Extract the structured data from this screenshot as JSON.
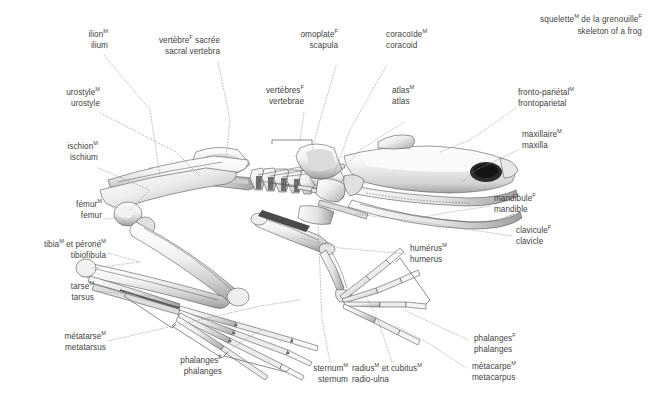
{
  "title": {
    "fr": "squelette",
    "fr_sup": "M",
    "fr_rest": " de la grenouille",
    "fr_sup2": "F",
    "en": "skeleton of a frog"
  },
  "figure": {
    "style": "grayscale anatomical illustration",
    "background_color": "#ffffff",
    "text_color": "#3f3f3f",
    "leader_line_color": "#9a9a9a"
  },
  "labels": [
    {
      "id": "ilium",
      "fr_main": "ilion",
      "fr_sup": "M",
      "fr_tail": "",
      "en": "ilium",
      "align": "right"
    },
    {
      "id": "sacral-vertebra",
      "fr_main": "vertèbre",
      "fr_sup": "F",
      "fr_tail": " sacrée",
      "en": "sacral vertebra",
      "align": "right"
    },
    {
      "id": "scapula",
      "fr_main": "omoplate",
      "fr_sup": "F",
      "fr_tail": "",
      "en": "scapula",
      "align": "right"
    },
    {
      "id": "coracoid",
      "fr_main": "coracoïde",
      "fr_sup": "M",
      "fr_tail": "",
      "en": "coracoid",
      "align": "left"
    },
    {
      "id": "urostyle",
      "fr_main": "urostyle",
      "fr_sup": "M",
      "fr_tail": "",
      "en": "urostyle",
      "align": "right"
    },
    {
      "id": "vertebrae",
      "fr_main": "vertèbres",
      "fr_sup": "F",
      "fr_tail": "",
      "en": "vertebrae",
      "align": "right"
    },
    {
      "id": "atlas",
      "fr_main": "atlas",
      "fr_sup": "M",
      "fr_tail": "",
      "en": "atlas",
      "align": "left"
    },
    {
      "id": "frontoparietal",
      "fr_main": "fronto-pariétal",
      "fr_sup": "M",
      "fr_tail": "",
      "en": "frontoparietal",
      "align": "left"
    },
    {
      "id": "ischium",
      "fr_main": "ischion",
      "fr_sup": "M",
      "fr_tail": "",
      "en": "ischium",
      "align": "right"
    },
    {
      "id": "maxilla",
      "fr_main": "maxillaire",
      "fr_sup": "M",
      "fr_tail": "",
      "en": "maxilla",
      "align": "left"
    },
    {
      "id": "femur",
      "fr_main": "fémur",
      "fr_sup": "M",
      "fr_tail": "",
      "en": "femur",
      "align": "right"
    },
    {
      "id": "mandible",
      "fr_main": "mandibule",
      "fr_sup": "F",
      "fr_tail": "",
      "en": "mandible",
      "align": "left"
    },
    {
      "id": "tibiofibula",
      "fr_main": "tibia",
      "fr_sup": "M",
      "fr_tail": " et péroné",
      "fr_sup2": "M",
      "en": "tibiofibula",
      "align": "right"
    },
    {
      "id": "clavicle",
      "fr_main": "clavicule",
      "fr_sup": "F",
      "fr_tail": "",
      "en": "clavicle",
      "align": "left"
    },
    {
      "id": "humerus",
      "fr_main": "humérus",
      "fr_sup": "M",
      "fr_tail": "",
      "en": "humerus",
      "align": "left"
    },
    {
      "id": "tarsus",
      "fr_main": "tarse",
      "fr_sup": "M",
      "fr_tail": "",
      "en": "tarsus",
      "align": "right"
    },
    {
      "id": "metatarsus",
      "fr_main": "métatarse",
      "fr_sup": "M",
      "fr_tail": "",
      "en": "metatarsus",
      "align": "right"
    },
    {
      "id": "phalanges-foot",
      "fr_main": "phalanges",
      "fr_sup": "F",
      "fr_tail": "",
      "en": "phalanges",
      "align": "right"
    },
    {
      "id": "sternum",
      "fr_main": "sternum",
      "fr_sup": "M",
      "fr_tail": "",
      "en": "sternum",
      "align": "right"
    },
    {
      "id": "radio-ulna",
      "fr_main": "radius",
      "fr_sup": "M",
      "fr_tail": " et cubitus",
      "fr_sup2": "M",
      "en": "radio-ulna",
      "align": "left"
    },
    {
      "id": "phalanges-hand",
      "fr_main": "phalanges",
      "fr_sup": "F",
      "fr_tail": "",
      "en": "phalanges",
      "align": "left"
    },
    {
      "id": "metacarpus",
      "fr_main": "métacarpe",
      "fr_sup": "M",
      "fr_tail": "",
      "en": "metacarpus",
      "align": "left"
    }
  ]
}
